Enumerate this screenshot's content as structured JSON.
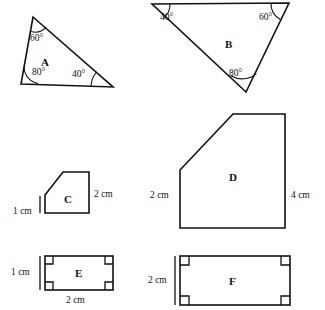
{
  "page": {
    "background_color": "#ffffff",
    "ink_color": "#111111",
    "width": 325,
    "height": 310
  },
  "figures": [
    {
      "id": "A",
      "label": "A",
      "type": "triangle",
      "label_pos": {
        "x": 41,
        "y": 57
      },
      "vertices": [
        {
          "x": 33,
          "y": 17
        },
        {
          "x": 113,
          "y": 87
        },
        {
          "x": 21,
          "y": 84
        }
      ],
      "angles": [
        {
          "value": "60°",
          "x": 30,
          "y": 34
        },
        {
          "value": "80°",
          "x": 32,
          "y": 68
        },
        {
          "value": "40°",
          "x": 72,
          "y": 70
        }
      ],
      "dimensions": []
    },
    {
      "id": "B",
      "label": "B",
      "type": "triangle",
      "label_pos": {
        "x": 225,
        "y": 39
      },
      "vertices": [
        {
          "x": 152,
          "y": 4
        },
        {
          "x": 289,
          "y": 3
        },
        {
          "x": 246,
          "y": 92
        }
      ],
      "angles": [
        {
          "value": "40°",
          "x": 160,
          "y": 13
        },
        {
          "value": "60°",
          "x": 259,
          "y": 13
        },
        {
          "value": "80°",
          "x": 229,
          "y": 69
        }
      ],
      "dimensions": []
    },
    {
      "id": "C",
      "label": "C",
      "type": "pentagon",
      "label_pos": {
        "x": 64,
        "y": 194
      },
      "vertices": [
        {
          "x": 63,
          "y": 172
        },
        {
          "x": 89,
          "y": 172
        },
        {
          "x": 89,
          "y": 213
        },
        {
          "x": 45,
          "y": 213
        },
        {
          "x": 45,
          "y": 195
        }
      ],
      "angles": [],
      "dimensions": [
        {
          "value": "1 cm",
          "x": 13,
          "y": 207,
          "side": "left"
        },
        {
          "value": "2 cm",
          "x": 94,
          "y": 190,
          "side": "right"
        }
      ]
    },
    {
      "id": "D",
      "label": "D",
      "type": "pentagon",
      "label_pos": {
        "x": 229,
        "y": 172
      },
      "vertices": [
        {
          "x": 233,
          "y": 114
        },
        {
          "x": 285,
          "y": 114
        },
        {
          "x": 285,
          "y": 228
        },
        {
          "x": 180,
          "y": 228
        },
        {
          "x": 180,
          "y": 170
        }
      ],
      "angles": [],
      "dimensions": [
        {
          "value": "2 cm",
          "x": 150,
          "y": 191,
          "side": "left"
        },
        {
          "value": "4 cm",
          "x": 291,
          "y": 191,
          "side": "right"
        }
      ]
    },
    {
      "id": "E",
      "label": "E",
      "type": "rectangle",
      "label_pos": {
        "x": 75,
        "y": 268
      },
      "vertices": [
        {
          "x": 45,
          "y": 256
        },
        {
          "x": 113,
          "y": 256
        },
        {
          "x": 113,
          "y": 290
        },
        {
          "x": 45,
          "y": 290
        }
      ],
      "angles": [],
      "right_angle_marks": 4,
      "dimensions": [
        {
          "value": "1 cm",
          "x": 11,
          "y": 268,
          "side": "left"
        },
        {
          "value": "2 cm",
          "x": 66,
          "y": 296,
          "side": "bottom"
        }
      ]
    },
    {
      "id": "F",
      "label": "F",
      "type": "rectangle",
      "label_pos": {
        "x": 229,
        "y": 276
      },
      "vertices": [
        {
          "x": 180,
          "y": 256
        },
        {
          "x": 290,
          "y": 256
        },
        {
          "x": 290,
          "y": 305
        },
        {
          "x": 180,
          "y": 305
        }
      ],
      "angles": [],
      "right_angle_marks": 4,
      "dimensions": [
        {
          "value": "2 cm",
          "x": 148,
          "y": 276,
          "side": "left"
        }
      ]
    }
  ]
}
